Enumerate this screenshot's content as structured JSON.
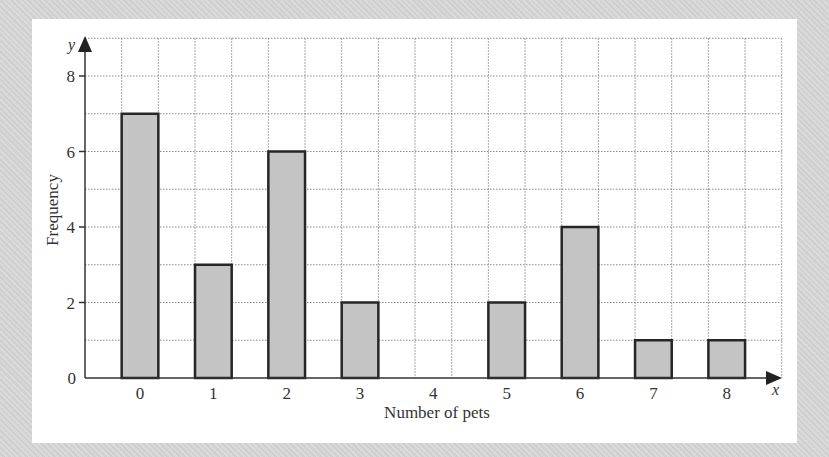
{
  "chart_data": {
    "type": "bar",
    "title": "",
    "xlabel": "Number of pets",
    "ylabel": "Frequency",
    "x_axis_var": "x",
    "y_axis_var": "y",
    "categories": [
      "0",
      "1",
      "2",
      "3",
      "4",
      "5",
      "6",
      "7",
      "8"
    ],
    "values": [
      7,
      3,
      6,
      2,
      0,
      2,
      4,
      1,
      1
    ],
    "y_ticks": [
      "0",
      "2",
      "4",
      "6",
      "8"
    ],
    "ylim": [
      0,
      9
    ],
    "grid": true,
    "legend": null
  },
  "colors": {
    "background": "#d6d6d6",
    "card": "#ffffff",
    "bar_fill": "#c4c4c4",
    "bar_stroke": "#262626",
    "grid": "#8a8a8a",
    "axis": "#333333"
  }
}
